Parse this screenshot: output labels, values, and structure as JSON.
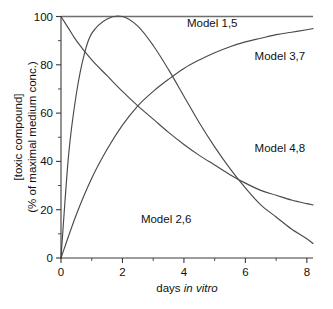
{
  "chart_data": {
    "type": "line",
    "title": "",
    "xlabel_plain": "days ",
    "xlabel_italic": "in vitro",
    "ylabel_line1": "[toxic compound]",
    "ylabel_line2": "(% of maximal medium conc.)",
    "xlim": [
      0,
      8.2
    ],
    "ylim": [
      0,
      100
    ],
    "xticks": [
      0,
      2,
      4,
      6,
      8
    ],
    "xticklabels": [
      "0",
      "2",
      "4",
      "6",
      "8"
    ],
    "xminorticks": [
      1,
      3,
      5,
      7
    ],
    "yticks": [
      0,
      20,
      40,
      60,
      80,
      100
    ],
    "yticklabels": [
      "0",
      "20",
      "40",
      "60",
      "80",
      "100"
    ],
    "yminorticks": [
      10,
      30,
      50,
      70,
      90
    ],
    "grid": false,
    "legend_position": "inline-annotations",
    "series": [
      {
        "name": "Model 1,5",
        "label": "Model 1,5",
        "label_x": 4.1,
        "label_y": 95.5,
        "description": "constant at maximal concentration",
        "x": [
          0,
          1,
          2,
          3,
          4,
          5,
          6,
          7,
          8,
          8.2
        ],
        "values": [
          100,
          100,
          100,
          100,
          100,
          100,
          100,
          100,
          100,
          100
        ]
      },
      {
        "name": "Model 2,6",
        "label": "Model 2,6",
        "label_x": 2.6,
        "label_y": 14.5,
        "description": "rapid rise then exponential decay to near zero",
        "x": [
          0,
          0.25,
          0.5,
          0.75,
          1,
          1.5,
          2,
          2.5,
          3,
          3.5,
          4,
          4.5,
          5,
          5.5,
          6,
          6.5,
          7,
          7.5,
          8,
          8.2
        ],
        "values": [
          0,
          43,
          68,
          84,
          93,
          99,
          100,
          96,
          88,
          78,
          67,
          56,
          46,
          37,
          29,
          22,
          17,
          12,
          8,
          6
        ]
      },
      {
        "name": "Model 3,7",
        "label": "Model 3,7",
        "label_x": 6.3,
        "label_y": 82,
        "description": "saturating exponential rise toward maximal concentration",
        "x": [
          0,
          0.5,
          1,
          1.5,
          2,
          2.5,
          3,
          3.5,
          4,
          4.5,
          5,
          5.5,
          6,
          6.5,
          7,
          7.5,
          8,
          8.2
        ],
        "values": [
          0,
          18,
          33,
          45,
          55,
          63,
          69,
          74,
          78.5,
          82,
          85,
          87.5,
          89.5,
          91,
          92.5,
          93.5,
          94.5,
          95
        ]
      },
      {
        "name": "Model 4,8",
        "label": "Model 4,8",
        "label_x": 6.3,
        "label_y": 44,
        "description": "exponential decay from maximal concentration",
        "x": [
          0,
          0.25,
          0.5,
          1,
          1.5,
          2,
          2.5,
          3,
          3.5,
          4,
          4.5,
          5,
          5.5,
          6,
          6.5,
          7,
          7.5,
          8,
          8.2
        ],
        "values": [
          100,
          95,
          90,
          82,
          75.5,
          69,
          63,
          57.5,
          52,
          47,
          42.5,
          38.5,
          34.5,
          31,
          28,
          26,
          24,
          22.5,
          22
        ]
      }
    ]
  }
}
